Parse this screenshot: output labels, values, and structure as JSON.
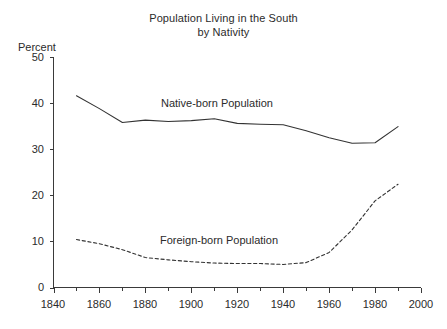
{
  "chart_data": {
    "type": "line",
    "title": "Population Living in the South by Nativity",
    "title_line1": "Population Living in the South",
    "title_line2": "by Nativity",
    "xlabel": "",
    "ylabel": "Percent",
    "ylabel_display": "Percent",
    "xlim": [
      1840,
      2000
    ],
    "ylim": [
      0,
      50
    ],
    "grid": false,
    "legend_position": "inline-annotations",
    "x_ticks": [
      1840,
      1860,
      1880,
      1900,
      1920,
      1940,
      1960,
      1980,
      2000
    ],
    "x_minor_ticks": [
      1850,
      1870,
      1890,
      1910,
      1930,
      1950,
      1970,
      1990
    ],
    "y_ticks": [
      0,
      10,
      20,
      30,
      40,
      50
    ],
    "x": [
      1850,
      1860,
      1870,
      1880,
      1890,
      1900,
      1910,
      1920,
      1930,
      1940,
      1950,
      1960,
      1970,
      1980,
      1990
    ],
    "series": [
      {
        "name": "Native-born Population",
        "label": "Native-born Population",
        "style": "solid",
        "color": "#333333",
        "values": [
          41.6,
          38.8,
          35.8,
          36.3,
          36.0,
          36.2,
          36.6,
          35.6,
          35.4,
          35.3,
          34.0,
          32.5,
          31.3,
          31.4,
          34.9
        ]
      },
      {
        "name": "Foreign-born Population",
        "label": "Foreign-born Population",
        "style": "dashed",
        "color": "#333333",
        "values": [
          10.4,
          9.5,
          8.2,
          6.5,
          6.0,
          5.6,
          5.3,
          5.2,
          5.2,
          5.0,
          5.4,
          7.6,
          12.5,
          18.8,
          22.4
        ]
      }
    ],
    "annotations": [
      {
        "text": "Native-born Population",
        "x": 1910,
        "y": 38.5
      },
      {
        "text": "Foreign-born Population",
        "x": 1908,
        "y": 11.5
      }
    ]
  }
}
